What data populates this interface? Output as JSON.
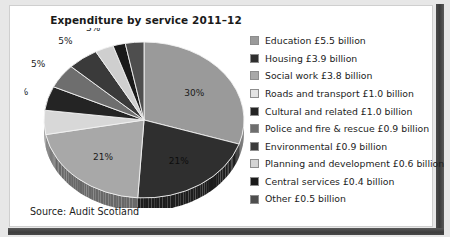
{
  "card": {
    "title": "Expenditure by service 2011–12",
    "source": "Source: Audit Scotland"
  },
  "chart_data": {
    "type": "pie",
    "title": "Expenditure by service 2011–12",
    "source": "Source: Audit Scotland",
    "unit": "£ billion",
    "legend_position": "right",
    "categories": [
      "Education",
      "Housing",
      "Social work",
      "Roads and transport",
      "Cultural and related",
      "Police and fire & rescue",
      "Environmental",
      "Planning and development",
      "Central services",
      "Other"
    ],
    "values": [
      5.5,
      3.9,
      3.8,
      1.0,
      1.0,
      0.9,
      0.9,
      0.6,
      0.4,
      0.5
    ],
    "percent_labels": [
      "30%",
      "21%",
      "21%",
      "5%",
      "5%",
      "5%",
      "3%",
      "2%",
      "3%"
    ],
    "colors": [
      "#9a9a9a",
      "#2f2f2f",
      "#a8a8a8",
      "#d8d8d8",
      "#242424",
      "#6e6e6e",
      "#3a3a3a",
      "#cfcfcf",
      "#1a1a1a",
      "#4e4e4e"
    ],
    "slices": [
      {
        "label": "Education",
        "amount": "£5.5 billion",
        "percent": 30,
        "percent_label": "30%",
        "color": "#9a9a9a"
      },
      {
        "label": "Housing",
        "amount": "£3.9 billion",
        "percent": 21,
        "percent_label": "21%",
        "color": "#2f2f2f"
      },
      {
        "label": "Social work",
        "amount": "£3.8 billion",
        "percent": 21,
        "percent_label": "21%",
        "color": "#a8a8a8"
      },
      {
        "label": "Roads and transport",
        "amount": "£1.0 billion",
        "percent": 5,
        "percent_label": "5%",
        "color": "#d8d8d8"
      },
      {
        "label": "Cultural and related",
        "amount": "£1.0 billion",
        "percent": 5,
        "percent_label": "5%",
        "color": "#242424"
      },
      {
        "label": "Police and fire & rescue",
        "amount": "£0.9 billion",
        "percent": 5,
        "percent_label": "5%",
        "color": "#6e6e6e"
      },
      {
        "label": "Environmental",
        "amount": "£0.9 billion",
        "percent": 5,
        "percent_label": "5%",
        "color": "#3a3a3a"
      },
      {
        "label": "Planning and development",
        "amount": "£0.6 billion",
        "percent": 3,
        "percent_label": "3%",
        "color": "#cfcfcf"
      },
      {
        "label": "Central services",
        "amount": "£0.4 billion",
        "percent": 2,
        "percent_label": "2%",
        "color": "#1a1a1a"
      },
      {
        "label": "Other",
        "amount": "£0.5 billion",
        "percent": 3,
        "percent_label": "3%",
        "color": "#4e4e4e"
      }
    ]
  },
  "legend": {
    "items": [
      {
        "text": "Education £5.5 billion",
        "color": "#9a9a9a"
      },
      {
        "text": "Housing £3.9 billion",
        "color": "#2f2f2f"
      },
      {
        "text": "Social work £3.8 billion",
        "color": "#a8a8a8"
      },
      {
        "text": "Roads and transport £1.0 billion",
        "color": "#e3e3e3"
      },
      {
        "text": "Cultural and related £1.0 billion",
        "color": "#242424"
      },
      {
        "text": "Police and fire & rescue £0.9 billion",
        "color": "#6e6e6e"
      },
      {
        "text": "Environmental £0.9 billion",
        "color": "#3a3a3a"
      },
      {
        "text": "Planning and development £0.6 billion",
        "color": "#d4d4d4"
      },
      {
        "text": "Central services £0.4 billion",
        "color": "#1a1a1a"
      },
      {
        "text": "Other £0.5 billion",
        "color": "#4e4e4e"
      }
    ]
  }
}
